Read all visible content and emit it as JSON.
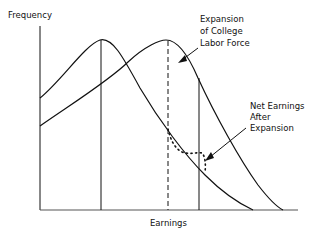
{
  "diagram": {
    "y_axis_label": "Frequency",
    "x_axis_label": "Earnings",
    "annotations": {
      "expansion": [
        "Expansion",
        "of College",
        "Labor Force"
      ],
      "net_earnings": [
        "Net Earnings",
        "After",
        "Expansion"
      ]
    },
    "curves": [
      {
        "name": "original-earnings-distribution",
        "style": "solid"
      },
      {
        "name": "expanded-earnings-distribution",
        "style": "solid"
      },
      {
        "name": "net-earnings-after-expansion",
        "style": "dotted"
      }
    ],
    "reference_lines": [
      {
        "name": "original-mode-line",
        "style": "solid"
      },
      {
        "name": "expanded-mode-line",
        "style": "dashed"
      },
      {
        "name": "threshold-line",
        "style": "solid"
      }
    ],
    "colors": {
      "ink": "#111111",
      "background": "#ffffff"
    }
  }
}
